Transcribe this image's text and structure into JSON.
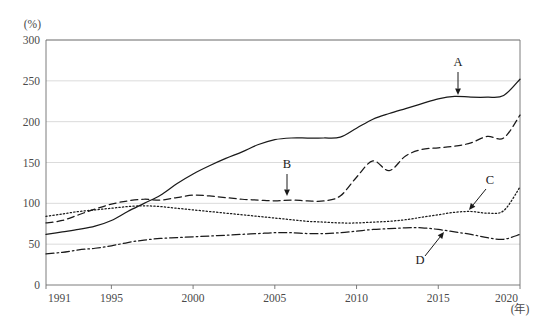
{
  "chart_data": {
    "type": "line",
    "title": "",
    "xlabel": "(年)",
    "ylabel": "(%)",
    "xlim": [
      1991,
      2020
    ],
    "ylim": [
      0,
      300
    ],
    "grid": true,
    "legend_position": "inline-annotations",
    "x_ticks": [
      "1991",
      "1995",
      "2000",
      "2005",
      "2010",
      "2015",
      "2020"
    ],
    "x_tick_values": [
      1991,
      1995,
      2000,
      2005,
      2010,
      2015,
      2020
    ],
    "y_ticks": [
      "0",
      "50",
      "100",
      "150",
      "200",
      "250",
      "300"
    ],
    "y_tick_values": [
      0,
      50,
      100,
      150,
      200,
      250,
      300
    ],
    "x": [
      1991,
      1992,
      1993,
      1994,
      1995,
      1996,
      1997,
      1998,
      1999,
      2000,
      2001,
      2002,
      2003,
      2004,
      2005,
      2006,
      2007,
      2008,
      2009,
      2010,
      2011,
      2012,
      2013,
      2014,
      2015,
      2016,
      2017,
      2018,
      2019,
      2020
    ],
    "series": [
      {
        "name": "A",
        "style": "solid",
        "values": [
          62,
          65,
          68,
          72,
          79,
          90,
          100,
          110,
          124,
          136,
          146,
          155,
          163,
          172,
          178,
          180,
          180,
          180,
          181,
          192,
          203,
          210,
          216,
          222,
          228,
          231,
          230,
          230,
          232,
          252
        ]
      },
      {
        "name": "B",
        "style": "dashed",
        "values": [
          76,
          79,
          86,
          93,
          99,
          103,
          105,
          104,
          107,
          110,
          109,
          107,
          105,
          104,
          103,
          104,
          103,
          103,
          109,
          132,
          152,
          140,
          158,
          166,
          168,
          170,
          174,
          182,
          180,
          208
        ]
      },
      {
        "name": "C",
        "style": "dotted",
        "values": [
          84,
          87,
          90,
          92,
          94,
          96,
          97,
          96,
          94,
          92,
          90,
          88,
          86,
          84,
          82,
          80,
          78,
          77,
          76,
          76,
          77,
          78,
          80,
          83,
          86,
          89,
          90,
          88,
          91,
          120
        ]
      },
      {
        "name": "D",
        "style": "dashdot",
        "values": [
          38,
          40,
          43,
          45,
          48,
          52,
          55,
          57,
          58,
          59,
          60,
          61,
          62,
          63,
          64,
          64,
          63,
          63,
          64,
          66,
          68,
          69,
          70,
          70,
          68,
          65,
          62,
          58,
          56,
          62
        ]
      }
    ],
    "annotations": [
      {
        "label": "A",
        "text_x": 458,
        "text_y": 66,
        "arrow_x1": 458,
        "arrow_y1": 72,
        "arrow_x2": 458,
        "arrow_y2": 95,
        "head": "down"
      },
      {
        "label": "B",
        "text_x": 287,
        "text_y": 168,
        "arrow_x1": 287,
        "arrow_y1": 174,
        "arrow_x2": 287,
        "arrow_y2": 196,
        "head": "down"
      },
      {
        "label": "C",
        "text_x": 490,
        "text_y": 184,
        "arrow_x1": 486,
        "arrow_y1": 189,
        "arrow_x2": 469,
        "arrow_y2": 210,
        "head": "downleft"
      },
      {
        "label": "D",
        "text_x": 420,
        "text_y": 264,
        "arrow_x1": 425,
        "arrow_y1": 256,
        "arrow_x2": 444,
        "arrow_y2": 232,
        "head": "upright"
      }
    ]
  },
  "plot_geometry": {
    "left": 46,
    "right": 520,
    "top": 40,
    "bottom": 285
  }
}
